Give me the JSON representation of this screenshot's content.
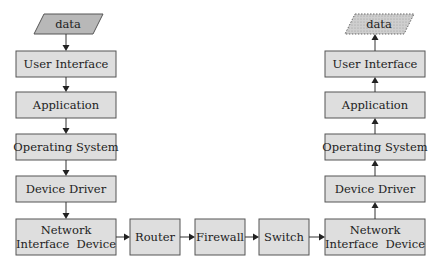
{
  "diagram": {
    "type": "flowchart",
    "sender": {
      "input": "data",
      "layers": [
        "User Interface",
        "Application",
        "Operating System",
        "Device Driver"
      ],
      "nic": [
        "Network",
        "Interface  Device"
      ]
    },
    "network": [
      "Router",
      "Firewall",
      "Switch"
    ],
    "receiver": {
      "output": "data",
      "layers": [
        "User Interface",
        "Application",
        "Operating System",
        "Device Driver"
      ],
      "nic": [
        "Network",
        "Interface  Device"
      ]
    },
    "edges": [
      {
        "from": "sender.input",
        "to": "sender.layers.0"
      },
      {
        "from": "sender.layers.0",
        "to": "sender.layers.1"
      },
      {
        "from": "sender.layers.1",
        "to": "sender.layers.2"
      },
      {
        "from": "sender.layers.2",
        "to": "sender.layers.3"
      },
      {
        "from": "sender.layers.3",
        "to": "sender.nic"
      },
      {
        "from": "sender.nic",
        "to": "network.0"
      },
      {
        "from": "network.0",
        "to": "network.1"
      },
      {
        "from": "network.1",
        "to": "network.2"
      },
      {
        "from": "network.2",
        "to": "receiver.nic"
      },
      {
        "from": "receiver.nic",
        "to": "receiver.layers.3"
      },
      {
        "from": "receiver.layers.3",
        "to": "receiver.layers.2"
      },
      {
        "from": "receiver.layers.2",
        "to": "receiver.layers.1"
      },
      {
        "from": "receiver.layers.1",
        "to": "receiver.layers.0"
      },
      {
        "from": "receiver.layers.0",
        "to": "receiver.output"
      }
    ],
    "colors": {
      "box_fill": "#dedede",
      "input_fill": "#b8b8b8",
      "output_fill": "#cccccc",
      "stroke": "#555555"
    }
  }
}
